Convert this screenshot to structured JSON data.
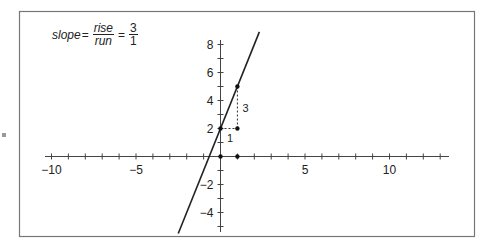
{
  "chart_data": {
    "type": "line",
    "title": "",
    "formula": {
      "lhs": "slope",
      "equals": "=",
      "rise_label": "rise",
      "run_label": "run",
      "rise_value": "3",
      "run_value": "1"
    },
    "xlabel": "",
    "ylabel": "",
    "xlim": [
      -10.3,
      13.5
    ],
    "ylim": [
      -5.4,
      8.5
    ],
    "x_ticks": [
      -10,
      -5,
      5,
      10
    ],
    "x_tick_labels": [
      "−10",
      "−5",
      "5",
      "10"
    ],
    "y_ticks": [
      -4,
      -2,
      2,
      4,
      6,
      8
    ],
    "y_tick_labels": [
      "−4",
      "−2",
      "2",
      "4",
      "6",
      "8"
    ],
    "grid": false,
    "legend": null,
    "series": [
      {
        "name": "y = 3x + 2",
        "slope": 3,
        "intercept": 2,
        "x_range": [
          -2.5,
          2.3
        ]
      }
    ],
    "points": [
      {
        "x": 0,
        "y": 0
      },
      {
        "x": 1,
        "y": 0
      },
      {
        "x": 0,
        "y": 2
      },
      {
        "x": 1,
        "y": 2
      },
      {
        "x": 1,
        "y": 5
      }
    ],
    "annotations": [
      {
        "text": "1",
        "at": [
          0.5,
          2
        ],
        "meaning": "run"
      },
      {
        "text": "3",
        "at": [
          1,
          3.5
        ],
        "meaning": "rise"
      }
    ]
  },
  "colors": {
    "line": "#222222",
    "axis": "#444444",
    "frame": "#777777",
    "dashed": "#333333"
  }
}
